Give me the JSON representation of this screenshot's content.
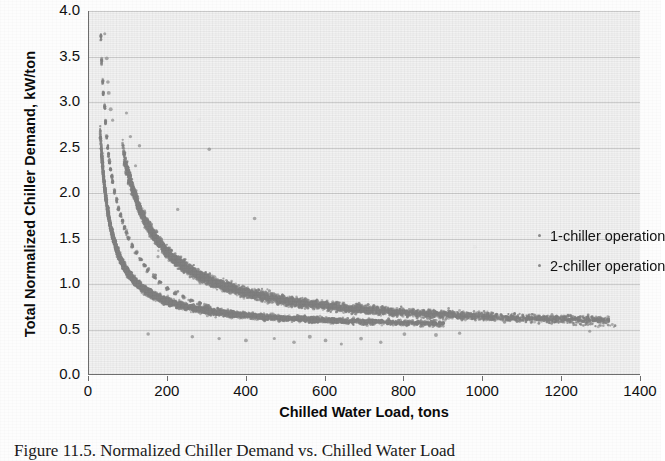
{
  "figure": {
    "caption": "Figure 11.5. Normalized Chiller Demand vs. Chilled Water Load"
  },
  "chart_data": {
    "type": "scatter",
    "title": "",
    "xlabel": "Chilled Water Load, tons",
    "ylabel": "Total Normalized Chiller Demand, kW/ton",
    "xlim": [
      0,
      1400
    ],
    "ylim": [
      0,
      4.0
    ],
    "xticks": [
      0,
      200,
      400,
      600,
      800,
      1000,
      1200,
      1400
    ],
    "yticks": [
      "0.0",
      "0.5",
      "1.0",
      "1.5",
      "2.0",
      "2.5",
      "3.0",
      "3.5",
      "4.0"
    ],
    "grid": "horizontal",
    "legend_position": "center-right",
    "marker_color": "#808080",
    "marker_size": 2,
    "series": [
      {
        "name": "1-chiller operation",
        "color": "#808080",
        "description": "Lower-left hyperbolic band; demand falls steeply from ~3.7 kW/ton near 30 tons to ~0.55 kW/ton by 500 tons, then flattens near 0.52.",
        "curve": {
          "a": 62.0,
          "b": 0.5,
          "x_start": 28,
          "x_end": 900,
          "spread": 0.045
        },
        "points": [
          [
            30,
            3.72
          ],
          [
            32,
            3.45
          ],
          [
            35,
            3.22
          ],
          [
            36,
            3.1
          ],
          [
            40,
            2.95
          ],
          [
            42,
            2.78
          ],
          [
            45,
            2.62
          ],
          [
            48,
            2.5
          ],
          [
            50,
            2.42
          ],
          [
            52,
            2.34
          ],
          [
            55,
            2.26
          ],
          [
            58,
            2.18
          ],
          [
            60,
            2.12
          ],
          [
            65,
            2.02
          ],
          [
            70,
            1.92
          ],
          [
            75,
            1.83
          ],
          [
            80,
            1.76
          ],
          [
            85,
            1.69
          ],
          [
            90,
            1.62
          ],
          [
            95,
            1.56
          ],
          [
            100,
            1.5
          ],
          [
            110,
            1.42
          ],
          [
            120,
            1.34
          ],
          [
            130,
            1.27
          ],
          [
            140,
            1.21
          ],
          [
            150,
            1.15
          ],
          [
            165,
            1.08
          ],
          [
            180,
            1.02
          ],
          [
            200,
            0.95
          ],
          [
            220,
            0.9
          ],
          [
            240,
            0.86
          ],
          [
            260,
            0.82
          ],
          [
            280,
            0.79
          ],
          [
            300,
            0.76
          ],
          [
            330,
            0.72
          ],
          [
            360,
            0.69
          ],
          [
            400,
            0.66
          ],
          [
            450,
            0.63
          ],
          [
            500,
            0.61
          ],
          [
            560,
            0.59
          ],
          [
            620,
            0.58
          ],
          [
            700,
            0.56
          ],
          [
            800,
            0.55
          ],
          [
            880,
            0.54
          ]
        ]
      },
      {
        "name": "2-chiller operation",
        "color": "#808080",
        "description": "Upper band shifted right; demand falls from ~2.3 kW/ton near 90 tons to ~0.55 kW/ton at 1300 tons, merging with the 1-chiller band at high load.",
        "curve": {
          "a": 175.0,
          "b": 0.47,
          "x_start": 85,
          "x_end": 1320,
          "spread": 0.055
        },
        "points": [
          [
            90,
            2.32
          ],
          [
            95,
            2.22
          ],
          [
            100,
            2.12
          ],
          [
            110,
            2.0
          ],
          [
            120,
            1.9
          ],
          [
            130,
            1.8
          ],
          [
            140,
            1.72
          ],
          [
            150,
            1.64
          ],
          [
            165,
            1.55
          ],
          [
            180,
            1.47
          ],
          [
            200,
            1.38
          ],
          [
            220,
            1.3
          ],
          [
            240,
            1.23
          ],
          [
            260,
            1.17
          ],
          [
            280,
            1.12
          ],
          [
            300,
            1.07
          ],
          [
            330,
            1.01
          ],
          [
            360,
            0.96
          ],
          [
            400,
            0.9
          ],
          [
            450,
            0.85
          ],
          [
            500,
            0.81
          ],
          [
            560,
            0.78
          ],
          [
            620,
            0.75
          ],
          [
            700,
            0.71
          ],
          [
            780,
            0.68
          ],
          [
            860,
            0.66
          ],
          [
            940,
            0.64
          ],
          [
            1020,
            0.62
          ],
          [
            1100,
            0.6
          ],
          [
            1180,
            0.58
          ],
          [
            1260,
            0.56
          ],
          [
            1320,
            0.54
          ]
        ]
      },
      {
        "name": "outliers",
        "color": "#8c8c8c",
        "description": "Sparse scattered points above and below the two main bands.",
        "points": [
          [
            40,
            3.75
          ],
          [
            45,
            3.48
          ],
          [
            48,
            3.22
          ],
          [
            50,
            3.1
          ],
          [
            55,
            2.92
          ],
          [
            60,
            2.8
          ],
          [
            95,
            2.88
          ],
          [
            105,
            2.62
          ],
          [
            128,
            2.52
          ],
          [
            305,
            2.48
          ],
          [
            118,
            2.3
          ],
          [
            225,
            1.82
          ],
          [
            420,
            1.72
          ],
          [
            175,
            1.3
          ],
          [
            150,
            0.45
          ],
          [
            262,
            0.42
          ],
          [
            330,
            0.4
          ],
          [
            398,
            0.38
          ],
          [
            470,
            0.4
          ],
          [
            520,
            0.36
          ],
          [
            560,
            0.42
          ],
          [
            600,
            0.38
          ],
          [
            640,
            0.34
          ],
          [
            690,
            0.4
          ],
          [
            740,
            0.36
          ],
          [
            800,
            0.45
          ],
          [
            880,
            0.44
          ],
          [
            940,
            0.46
          ],
          [
            1270,
            0.48
          ]
        ]
      }
    ]
  },
  "axes": {
    "x_title": "Chilled Water Load, tons",
    "y_title": "Total Normalized Chiller Demand, kW/ton",
    "x_tick_labels": [
      "0",
      "200",
      "400",
      "600",
      "800",
      "1000",
      "1200",
      "1400"
    ],
    "y_tick_labels": [
      "4.0",
      "3.5",
      "3.0",
      "2.5",
      "2.0",
      "1.5",
      "1.0",
      "0.5",
      "0.0"
    ]
  },
  "legend": {
    "items": [
      {
        "label": "1-chiller operation",
        "marker": "dot-marker"
      },
      {
        "label": "2-chiller operation",
        "marker": "dot-marker"
      }
    ]
  }
}
